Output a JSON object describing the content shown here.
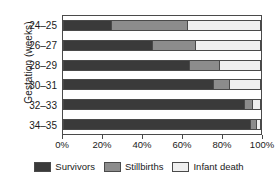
{
  "chart_data": {
    "type": "bar",
    "orientation": "horizontal",
    "stacked": true,
    "stack_mode": "percent",
    "title": "",
    "xlabel": "",
    "ylabel": "Gestation (weeks)",
    "categories": [
      "24–25",
      "26–27",
      "28–29",
      "30–31",
      "32–33",
      "34–35"
    ],
    "series": [
      {
        "name": "Survivors",
        "color": "#3a3a3a",
        "values": [
          24,
          45,
          64,
          76,
          92,
          95
        ]
      },
      {
        "name": "Stillbirths",
        "color": "#8c8c8c",
        "values": [
          39,
          22,
          15,
          8,
          4,
          3
        ]
      },
      {
        "name": "Infant death",
        "color": "#efefef",
        "values": [
          37,
          33,
          21,
          16,
          4,
          2
        ]
      }
    ],
    "xlim": [
      0,
      100
    ],
    "x_ticks": [
      0,
      20,
      40,
      60,
      80,
      100
    ],
    "x_tick_labels": [
      "0%",
      "20%",
      "40%",
      "60%",
      "80%",
      "100%"
    ],
    "grid": false,
    "legend_position": "bottom"
  },
  "axes": {
    "y_title": "Gestation (weeks)",
    "y_tick_labels": [
      "24–25",
      "26–27",
      "28–29",
      "30–31",
      "32–33",
      "34–35"
    ],
    "x_tick_labels": [
      "0%",
      "20%",
      "40%",
      "60%",
      "80%",
      "100%"
    ]
  },
  "legend": {
    "items": [
      {
        "label": "Survivors",
        "color": "#3a3a3a"
      },
      {
        "label": "Stillbirths",
        "color": "#8c8c8c"
      },
      {
        "label": "Infant death",
        "color": "#efefef"
      }
    ]
  }
}
